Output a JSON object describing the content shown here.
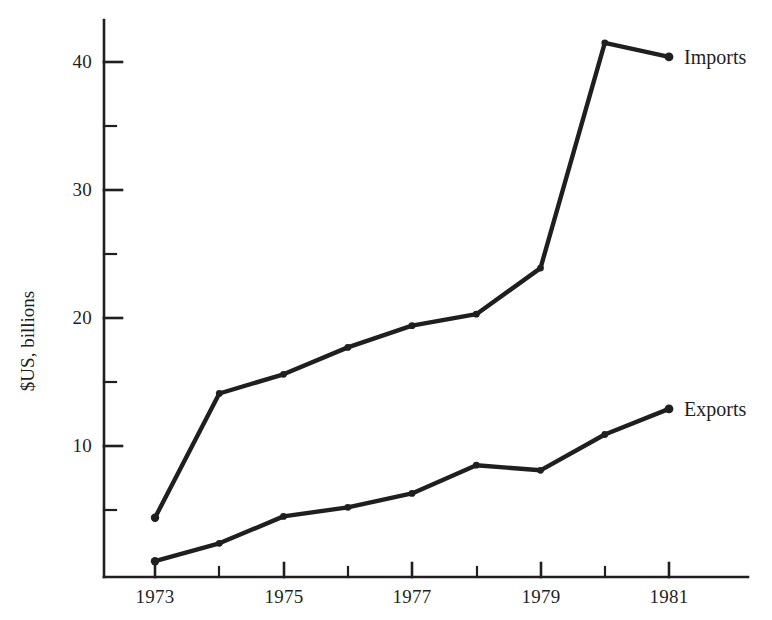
{
  "chart_data": {
    "type": "line",
    "title": "",
    "xlabel": "",
    "ylabel": "$US, billions",
    "x": [
      1973,
      1974,
      1975,
      1976,
      1977,
      1978,
      1979,
      1980,
      1981
    ],
    "xlim": [
      1972.5,
      1981.9
    ],
    "ylim": [
      0,
      44
    ],
    "xticks": [
      1973,
      1974,
      1975,
      1976,
      1977,
      1978,
      1979,
      1980,
      1981
    ],
    "xtick_labels": [
      "1973",
      "",
      "1975",
      "",
      "1977",
      "",
      "1979",
      "",
      "1981"
    ],
    "yticks": [
      5,
      10,
      15,
      20,
      25,
      30,
      35,
      40
    ],
    "ytick_labels": [
      "",
      "10",
      "",
      "20",
      "",
      "30",
      "",
      "40"
    ],
    "grid": false,
    "legend_position": "inline-right-of-last-point",
    "markers": "filled-circle",
    "series": [
      {
        "name": "Imports",
        "values": [
          4.4,
          14.1,
          15.6,
          17.7,
          19.4,
          20.3,
          23.9,
          41.5,
          40.4
        ]
      },
      {
        "name": "Exports",
        "values": [
          1.0,
          2.4,
          4.5,
          5.2,
          6.3,
          8.5,
          8.1,
          10.9,
          12.9
        ]
      }
    ]
  },
  "axes": {
    "y_title": "$US, billions",
    "y_tick_texts": [
      "40",
      "30",
      "20",
      "10"
    ],
    "x_tick_texts": [
      "1973",
      "1975",
      "1977",
      "1979",
      "1981"
    ]
  },
  "labels": {
    "imports": "Imports",
    "exports": "Exports"
  },
  "style": {
    "line_color": "#1f1f1f",
    "axis_color": "#1f1f1f",
    "background": "#ffffff"
  }
}
